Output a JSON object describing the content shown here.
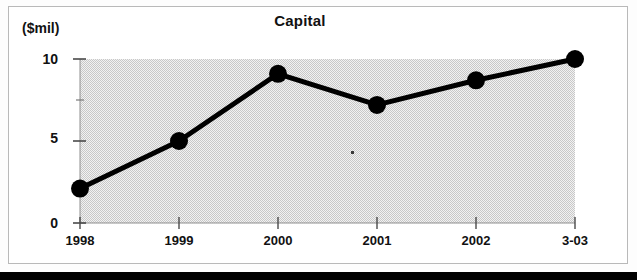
{
  "figure": {
    "title": "Capital",
    "y_axis_caption": "($mil)"
  },
  "chart_data": {
    "type": "line",
    "title": "Capital",
    "xlabel": "",
    "ylabel": "($mil)",
    "categories": [
      "1998",
      "1999",
      "2000",
      "2001",
      "2002",
      "3-03"
    ],
    "values": [
      2.1,
      5.0,
      9.1,
      7.2,
      8.7,
      10.0
    ],
    "series": [
      {
        "name": "Capital",
        "values": [
          2.1,
          5.0,
          9.1,
          7.2,
          8.7,
          10.0
        ]
      }
    ],
    "ylim": [
      0,
      10
    ],
    "y_major_ticks": [
      0,
      5,
      10
    ],
    "y_major_tick_labels": [
      "0",
      "5",
      "10"
    ],
    "y_minor_ticks": [
      2.5,
      7.5
    ],
    "grid": false,
    "legend": "none",
    "marker": "filled-circle",
    "line_color": "#000000",
    "marker_color": "#000000",
    "plot_background": "#e6e6e6"
  },
  "axes": {
    "y_labels": [
      "10",
      "5",
      "0"
    ],
    "x_labels": [
      "1998",
      "1999",
      "2000",
      "2001",
      "2002",
      "3-03"
    ]
  }
}
